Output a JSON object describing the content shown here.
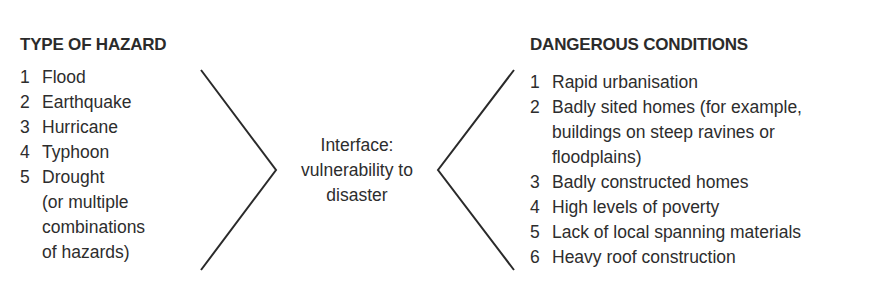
{
  "diagram": {
    "left": {
      "heading": "TYPE OF HAZARD",
      "items": [
        {
          "num": "1",
          "lines": [
            "Flood"
          ]
        },
        {
          "num": "2",
          "lines": [
            "Earthquake"
          ]
        },
        {
          "num": "3",
          "lines": [
            "Hurricane"
          ]
        },
        {
          "num": "4",
          "lines": [
            "Typhoon"
          ]
        },
        {
          "num": "5",
          "lines": [
            "Drought",
            "(or multiple",
            "combinations",
            "of hazards)"
          ]
        }
      ]
    },
    "center": {
      "lines": [
        "Interface:",
        "vulnerability to",
        "disaster"
      ]
    },
    "right": {
      "heading": "DANGEROUS CONDITIONS",
      "items": [
        {
          "num": "1",
          "lines": [
            "Rapid urbanisation"
          ]
        },
        {
          "num": "2",
          "lines": [
            "Badly sited homes (for example,",
            "buildings on steep ravines or",
            "floodplains)"
          ]
        },
        {
          "num": "3",
          "lines": [
            "Badly constructed homes"
          ]
        },
        {
          "num": "4",
          "lines": [
            "High levels of poverty"
          ]
        },
        {
          "num": "5",
          "lines": [
            "Lack of local spanning materials"
          ]
        },
        {
          "num": "6",
          "lines": [
            "Heavy roof construction"
          ]
        }
      ]
    },
    "line_color": "#2a2a2a"
  }
}
